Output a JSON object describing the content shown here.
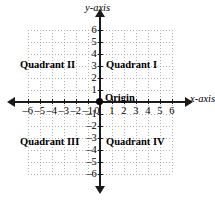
{
  "figure": {
    "type": "coordinate-plane",
    "background_color": "#ffffff",
    "axis_color": "#1a1a1a",
    "grid_color": "#b0b0b0"
  },
  "axes": {
    "x_label": "x-axis",
    "y_label": "y-axis",
    "x_ticks": [
      -6,
      -5,
      -4,
      -3,
      -2,
      -1,
      0,
      1,
      2,
      3,
      4,
      5,
      6
    ],
    "y_ticks": [
      -6,
      -5,
      -4,
      -3,
      -2,
      -1,
      1,
      2,
      3,
      4,
      5,
      6
    ],
    "x_tick_labels": [
      "–6",
      "–5",
      "–4",
      "–3",
      "–2",
      "–1",
      "0",
      "1",
      "2",
      "3",
      "4",
      "5",
      "6"
    ],
    "y_tick_labels": [
      "6",
      "5",
      "4",
      "3",
      "2",
      "1",
      "–1",
      "–2",
      "–3",
      "–4",
      "–5",
      "–6"
    ],
    "xlim": [
      -6,
      6
    ],
    "ylim": [
      -6,
      6
    ],
    "grid": true,
    "grid_style": "dotted",
    "arrowheads": [
      "left",
      "right",
      "up",
      "down"
    ]
  },
  "origin": {
    "label": "Origin",
    "marker": "filled-dot",
    "coordinates": [
      0,
      0
    ]
  },
  "quadrants": {
    "q1": "Quadrant I",
    "q2": "Quadrant II",
    "q3": "Quadrant III",
    "q4": "Quadrant IV"
  },
  "chart_data": {
    "type": "scatter",
    "title": "",
    "xlabel": "x-axis",
    "ylabel": "y-axis",
    "xlim": [
      -6,
      6
    ],
    "ylim": [
      -6,
      6
    ],
    "grid": true,
    "legend": "none",
    "x": [
      0
    ],
    "y": [
      0
    ],
    "point_labels": [
      "Origin"
    ],
    "annotations": [
      {
        "text": "Quadrant I",
        "x": 3,
        "y": 3.2
      },
      {
        "text": "Quadrant II",
        "x": -3.2,
        "y": 3.2
      },
      {
        "text": "Quadrant III",
        "x": -3.2,
        "y": -3.2
      },
      {
        "text": "Quadrant IV",
        "x": 3,
        "y": -3.2
      },
      {
        "text": "Origin",
        "x": 0.5,
        "y": 0.6
      }
    ]
  }
}
